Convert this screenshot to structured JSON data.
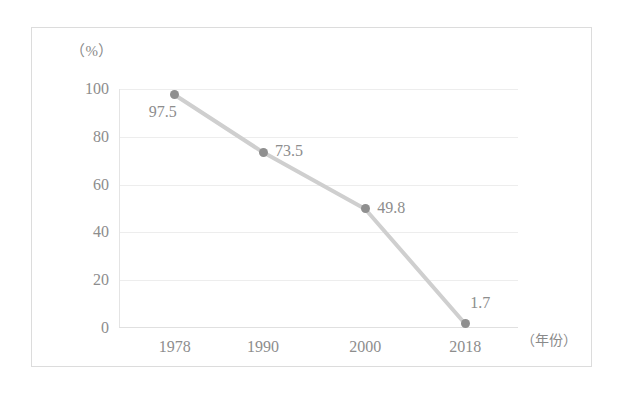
{
  "chart_data": {
    "type": "line",
    "title": "",
    "subtitle": "",
    "xlabel": "（年份）",
    "ylabel": "（%）",
    "categories": [
      "1978",
      "1990",
      "2000",
      "2018"
    ],
    "x": [
      1978,
      1990,
      2000,
      2018
    ],
    "values": [
      97.5,
      73.5,
      49.8,
      1.7
    ],
    "point_labels": [
      "97.5",
      "73.5",
      "49.8",
      "1.7"
    ],
    "series": [
      {
        "name": "",
        "values": [
          97.5,
          73.5,
          49.8,
          1.7
        ]
      }
    ],
    "ylim": [
      0,
      100
    ],
    "y_ticks": [
      "0",
      "20",
      "40",
      "60",
      "80",
      "100"
    ],
    "y_tick_values": [
      0,
      20,
      40,
      60,
      80,
      100
    ],
    "grid": true,
    "legend": "none",
    "line_color": "#cfcfcf",
    "marker_color": "#8f8f8f",
    "text_color": "#8d8d8d",
    "grid_color": "#ededed",
    "frame_color": "#dcdcdc",
    "background": "#ffffff"
  }
}
